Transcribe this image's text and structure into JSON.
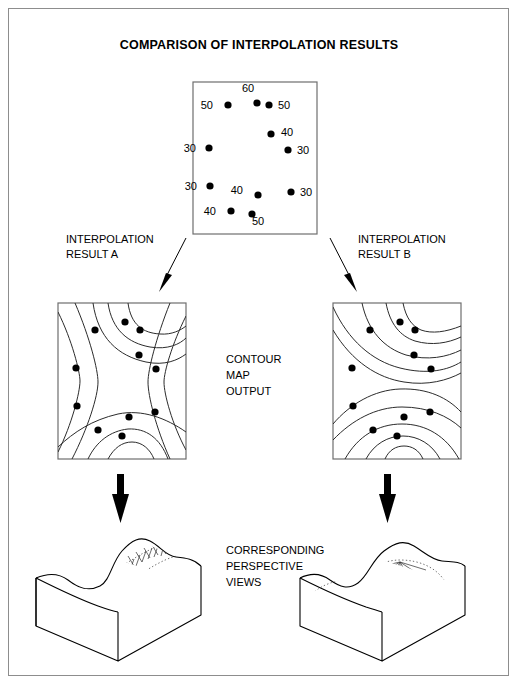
{
  "figure": {
    "title": "COMPARISON OF INTERPOLATION RESULTS",
    "border_color": "#8d8d8d",
    "background": "#ffffff"
  },
  "labels": {
    "result_a_line1": "INTERPOLATION",
    "result_a_line2": "RESULT A",
    "result_b_line1": "INTERPOLATION",
    "result_b_line2": "RESULT B",
    "center_line1": "CONTOUR",
    "center_line2": "MAP",
    "center_line3": "OUTPUT",
    "views_line1": "CORRESPONDING",
    "views_line2": "PERSPECTIVE",
    "views_line3": "VIEWS"
  },
  "chart_data": {
    "type": "scatter",
    "title": "COMPARISON OF INTERPOLATION RESULTS",
    "xlabel": "",
    "ylabel": "",
    "grid": false,
    "legend": "none",
    "point_map": {
      "box": {
        "x": 193,
        "y": 82,
        "width": 124,
        "height": 152
      },
      "value_unit": "elevation",
      "points": [
        {
          "value": "60",
          "x": 257,
          "y": 103,
          "label_x": 248,
          "label_y": 92,
          "label_side": "above"
        },
        {
          "value": "50",
          "x": 228,
          "y": 105,
          "label_x": 213,
          "label_y": 105,
          "label_side": "left"
        },
        {
          "value": "50",
          "x": 269,
          "y": 105,
          "label_x": 278,
          "label_y": 105,
          "label_side": "right"
        },
        {
          "value": "40",
          "x": 271,
          "y": 134,
          "label_x": 281,
          "label_y": 132,
          "label_side": "right"
        },
        {
          "value": "30",
          "x": 209,
          "y": 148,
          "label_x": 196,
          "label_y": 148,
          "label_side": "left"
        },
        {
          "value": "30",
          "x": 288,
          "y": 150,
          "label_x": 297,
          "label_y": 150,
          "label_side": "right"
        },
        {
          "value": "30",
          "x": 210,
          "y": 186,
          "label_x": 197,
          "label_y": 186,
          "label_side": "left"
        },
        {
          "value": "40",
          "x": 258,
          "y": 195,
          "label_x": 243,
          "label_y": 190,
          "label_side": "left"
        },
        {
          "value": "30",
          "x": 291,
          "y": 192,
          "label_x": 300,
          "label_y": 192,
          "label_side": "right"
        },
        {
          "value": "40",
          "x": 231,
          "y": 211,
          "label_x": 216,
          "label_y": 211,
          "label_side": "left"
        },
        {
          "value": "50",
          "x": 252,
          "y": 214,
          "label_x": 258,
          "label_y": 225,
          "label_side": "below"
        }
      ]
    },
    "contour_map_a": {
      "box": {
        "x": 58,
        "y": 303,
        "width": 128,
        "height": 156
      },
      "pattern": "saddle",
      "note": "Nested closed contours at top and bottom with near-vertical contours along the left and right sides.",
      "sample_dots": [
        {
          "x": 95,
          "y": 330
        },
        {
          "x": 125,
          "y": 322
        },
        {
          "x": 140,
          "y": 330
        },
        {
          "x": 139,
          "y": 355
        },
        {
          "x": 76,
          "y": 368
        },
        {
          "x": 156,
          "y": 369
        },
        {
          "x": 77,
          "y": 406
        },
        {
          "x": 155,
          "y": 412
        },
        {
          "x": 129,
          "y": 417
        },
        {
          "x": 98,
          "y": 430
        },
        {
          "x": 122,
          "y": 436
        }
      ]
    },
    "contour_map_b": {
      "box": {
        "x": 333,
        "y": 303,
        "width": 128,
        "height": 156
      },
      "pattern": "concentric-arcs",
      "note": "Two families of broad concentric arcs opening toward the top and bottom edges; no vertical side contours.",
      "sample_dots": [
        {
          "x": 370,
          "y": 330
        },
        {
          "x": 400,
          "y": 322
        },
        {
          "x": 415,
          "y": 330
        },
        {
          "x": 414,
          "y": 355
        },
        {
          "x": 352,
          "y": 368
        },
        {
          "x": 431,
          "y": 369
        },
        {
          "x": 353,
          "y": 406
        },
        {
          "x": 430,
          "y": 412
        },
        {
          "x": 404,
          "y": 417
        },
        {
          "x": 373,
          "y": 430
        },
        {
          "x": 397,
          "y": 436
        }
      ]
    },
    "perspective_a": {
      "box": {
        "x": 36,
        "y": 533,
        "width": 165,
        "height": 95
      },
      "note": "Block diagram showing a single continuous diagonal ridge crossing the surface."
    },
    "perspective_b": {
      "box": {
        "x": 300,
        "y": 533,
        "width": 165,
        "height": 95
      },
      "note": "Block diagram showing two separate rounded hills."
    }
  },
  "arrows": {
    "diagonal_left": "arrow-down-left",
    "diagonal_right": "arrow-down-right",
    "thick_left": "arrow-down",
    "thick_right": "arrow-down"
  }
}
